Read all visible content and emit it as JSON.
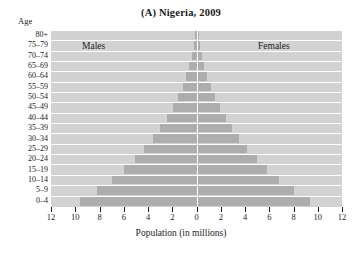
{
  "title": {
    "panel": "(A)",
    "text": "Nigeria, 2009",
    "full": "(A) Nigeria, 2009"
  },
  "axis_caption": "Age",
  "series_labels": {
    "male": "Males",
    "female": "Females"
  },
  "xlabel": "Population (in millions)",
  "xticks": [
    "12",
    "10",
    "8",
    "6",
    "4",
    "2",
    "0",
    "2",
    "4",
    "6",
    "8",
    "10",
    "12"
  ],
  "colors": {
    "bar": "#adadad",
    "plot_background": "#d2d2d2",
    "gridline": "#ffffff",
    "text": "#1b1b1b"
  },
  "chart_data": {
    "type": "bar",
    "subtype": "population-pyramid",
    "title": "(A) Nigeria, 2009",
    "xlabel": "Population (in millions)",
    "ylabel": "Age",
    "categories": [
      "0–4",
      "5–9",
      "10–14",
      "15–19",
      "20–24",
      "25–29",
      "30–34",
      "35–39",
      "40–44",
      "45–49",
      "50–54",
      "55–59",
      "60–64",
      "65–69",
      "70–74",
      "75–79",
      "80+"
    ],
    "series": [
      {
        "name": "Males",
        "values": [
          9.6,
          8.2,
          7.0,
          6.0,
          5.1,
          4.3,
          3.6,
          3.0,
          2.4,
          1.9,
          1.5,
          1.1,
          0.85,
          0.6,
          0.4,
          0.22,
          0.15
        ]
      },
      {
        "name": "Females",
        "values": [
          9.4,
          8.0,
          6.8,
          5.8,
          5.0,
          4.2,
          3.5,
          2.9,
          2.4,
          1.9,
          1.5,
          1.2,
          0.9,
          0.65,
          0.45,
          0.25,
          0.2
        ]
      }
    ],
    "xlim": [
      -12,
      12
    ],
    "xtick_values": [
      -12,
      -10,
      -8,
      -6,
      -4,
      -2,
      0,
      2,
      4,
      6,
      8,
      10,
      12
    ],
    "xtick_labels": [
      "12",
      "10",
      "8",
      "6",
      "4",
      "2",
      "0",
      "2",
      "4",
      "6",
      "8",
      "10",
      "12"
    ],
    "grid": true,
    "legend": "inline-panel-labels"
  }
}
